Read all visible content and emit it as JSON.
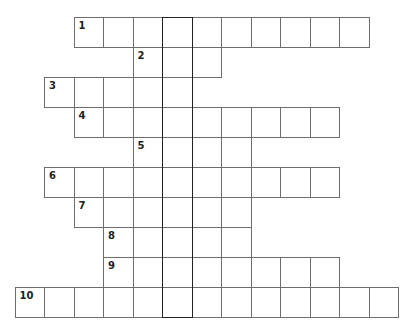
{
  "puzzle": {
    "type": "crossword",
    "cell_size": 29.5,
    "origin_x": 14.5,
    "origin_y": 17,
    "highlight_column": 5,
    "rows": [
      {
        "number": "1",
        "start_col": 2,
        "length": 10
      },
      {
        "number": "2",
        "start_col": 4,
        "length": 3
      },
      {
        "number": "3",
        "start_col": 1,
        "length": 5
      },
      {
        "number": "4",
        "start_col": 2,
        "length": 9
      },
      {
        "number": "5",
        "start_col": 4,
        "length": 4
      },
      {
        "number": "6",
        "start_col": 1,
        "length": 10
      },
      {
        "number": "7",
        "start_col": 2,
        "length": 6
      },
      {
        "number": "8",
        "start_col": 3,
        "length": 5
      },
      {
        "number": "9",
        "start_col": 3,
        "length": 8
      },
      {
        "number": "10",
        "start_col": 0,
        "length": 13
      }
    ]
  },
  "colors": {
    "grid_line": "#6e6e6e",
    "highlight_border": "#222222",
    "background": "#ffffff",
    "number_text": "#222222"
  }
}
